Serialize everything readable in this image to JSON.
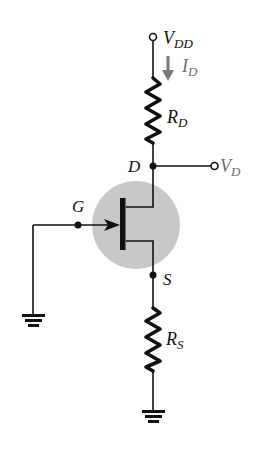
{
  "diagram": {
    "type": "circuit",
    "colors": {
      "wire": "#111111",
      "transistor_circle": "#c8c8c8",
      "current_arrow": "#7a7a7a",
      "label": "#111111",
      "current_label": "#6e6e6e"
    },
    "labels": {
      "vdd": {
        "main": "V",
        "sub": "DD"
      },
      "id": {
        "main": "I",
        "sub": "D"
      },
      "rd": {
        "main": "R",
        "sub": "D"
      },
      "drain": {
        "main": "D"
      },
      "vd": {
        "main": "V",
        "sub": "D"
      },
      "gate": {
        "main": "G"
      },
      "source": {
        "main": "S"
      },
      "rs": {
        "main": "R",
        "sub": "S"
      }
    },
    "components": [
      {
        "id": "vdd-terminal",
        "kind": "terminal",
        "label": "V_DD"
      },
      {
        "id": "drain-current",
        "kind": "current-arrow",
        "label": "I_D",
        "direction": "down"
      },
      {
        "id": "rd",
        "kind": "resistor",
        "label": "R_D"
      },
      {
        "id": "drain-node",
        "kind": "node",
        "label": "D"
      },
      {
        "id": "vd-terminal",
        "kind": "terminal",
        "label": "V_D"
      },
      {
        "id": "jfet",
        "kind": "n-channel-jfet"
      },
      {
        "id": "gate-node",
        "kind": "node",
        "label": "G"
      },
      {
        "id": "source-node",
        "kind": "node",
        "label": "S"
      },
      {
        "id": "rs",
        "kind": "resistor",
        "label": "R_S"
      },
      {
        "id": "gate-ground",
        "kind": "ground"
      },
      {
        "id": "source-ground",
        "kind": "ground"
      }
    ]
  }
}
